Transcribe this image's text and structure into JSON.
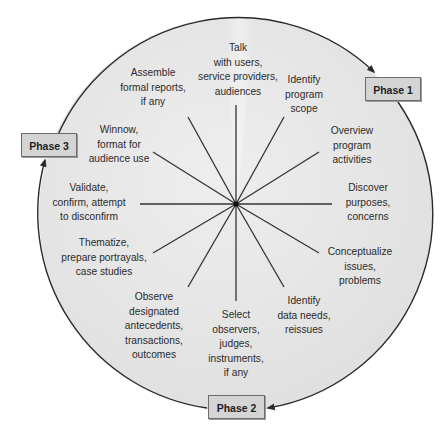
{
  "diagram": {
    "type": "responsive-evaluation-clock",
    "colors": {
      "circle_fill": "#e2e2e2",
      "circle_highlight": "#f0f0f0",
      "outline": "#2a2a2a",
      "spoke": "#333333",
      "text": "#2b2b2b",
      "phase_box_fill": "#d4d4d4",
      "phase_box_border": "#6b6b6b"
    },
    "center": {
      "x": 236,
      "y": 204
    },
    "phases": [
      {
        "id": "phase1",
        "label": "Phase 1"
      },
      {
        "id": "phase2",
        "label": "Phase 2"
      },
      {
        "id": "phase3",
        "label": "Phase 3"
      }
    ],
    "steps": [
      {
        "position": "12 o'clock",
        "lines": [
          "Talk",
          "with users,",
          "service providers,",
          "audiences"
        ]
      },
      {
        "position": "1 o'clock",
        "lines": [
          "Identify",
          "program",
          "scope"
        ]
      },
      {
        "position": "2 o'clock",
        "lines": [
          "Overview",
          "program",
          "activities"
        ]
      },
      {
        "position": "3 o'clock",
        "lines": [
          "Discover",
          "purposes,",
          "concerns"
        ]
      },
      {
        "position": "4 o'clock",
        "lines": [
          "Conceptualize",
          "issues,",
          "problems"
        ]
      },
      {
        "position": "5 o'clock",
        "lines": [
          "Identify",
          "data needs,",
          "reissues"
        ]
      },
      {
        "position": "6 o'clock",
        "lines": [
          "Select",
          "observers,",
          "judges,",
          "instruments,",
          "if any"
        ]
      },
      {
        "position": "7 o'clock",
        "lines": [
          "Observe",
          "designated",
          "antecedents,",
          "transactions,",
          "outcomes"
        ]
      },
      {
        "position": "8 o'clock",
        "lines": [
          "Thematize,",
          "prepare portrayals,",
          "case studies"
        ]
      },
      {
        "position": "9 o'clock",
        "lines": [
          "Validate,",
          "confirm, attempt",
          "to disconfirm"
        ]
      },
      {
        "position": "10 o'clock",
        "lines": [
          "Winnow,",
          "format for",
          "audience use"
        ]
      },
      {
        "position": "11 o'clock",
        "lines": [
          "Assemble",
          "formal reports,",
          "if any"
        ]
      }
    ]
  }
}
